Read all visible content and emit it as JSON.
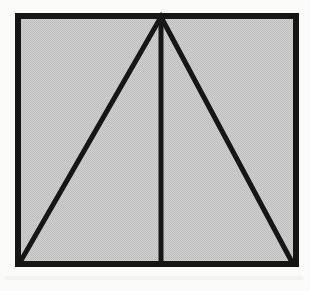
{
  "figure": {
    "canvas": {
      "width": 310,
      "height": 291,
      "background": "#fbfbfa"
    },
    "square": {
      "path": "M18,16 H296 V264 H18 Z",
      "stroke": "#161616",
      "stroke_width": 6,
      "fill_light": "#d2d2d2",
      "fill_dark": "#bcbcbc",
      "box_css": "left:18px;top:16px;width:278px;height:248px;background-color:#c7c7c7;background-image:repeating-conic-gradient(#d2d2d2 0% 25%, #bcbcbc 0% 50%);background-size:2px 2px"
    },
    "triangle": {
      "sides_path": "M19,264 L161,17 L293,264",
      "median_path": "M161,17 L161,264",
      "stroke": "#161616",
      "stroke_width": 5
    },
    "scan_artifact": {
      "streak_color": "#ececec"
    }
  }
}
